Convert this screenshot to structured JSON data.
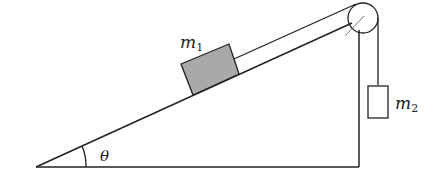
{
  "diagram": {
    "type": "incline-pulley",
    "labels": {
      "block1_main": "m",
      "block1_sub": "1",
      "block2_main": "m",
      "block2_sub": "2",
      "angle": "θ"
    },
    "colors": {
      "stroke": "#222222",
      "block1_fill": "#a9a9a9",
      "block2_fill": "#ffffff",
      "pulley_fill": "#ffffff"
    }
  }
}
